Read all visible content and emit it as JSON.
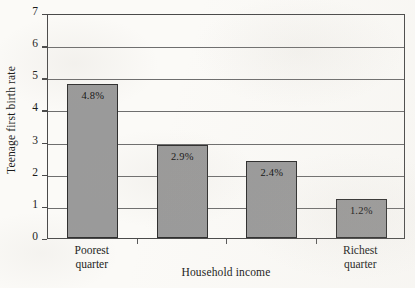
{
  "chart_data": {
    "type": "bar",
    "title": "",
    "subtitle": "",
    "xlabel": "Household income",
    "ylabel": "Teenage first birth rate",
    "categories": [
      "Poorest quarter",
      "",
      "",
      "Richest quarter"
    ],
    "values": [
      4.8,
      2.9,
      2.4,
      1.2
    ],
    "data_labels": [
      "4.8%",
      "2.9%",
      "2.4%",
      "1.2%"
    ],
    "ylim": [
      0,
      7
    ],
    "ytick_labels": [
      "0",
      "1",
      "2",
      "3",
      "4",
      "5",
      "6",
      "7"
    ],
    "grid": "horizontal",
    "legend": "none",
    "bar_color": "#9a9a9a",
    "bar_border_color": "#2e2e2e",
    "axis_color": "#4a4a4a",
    "background_color": "#fbfaf7"
  },
  "axes": {
    "y_title": "Teenage first birth rate",
    "x_title": "Household income"
  },
  "x_categories": [
    {
      "line1": "Poorest",
      "line2": "quarter"
    },
    {
      "line1": "Richest",
      "line2": "quarter"
    }
  ]
}
